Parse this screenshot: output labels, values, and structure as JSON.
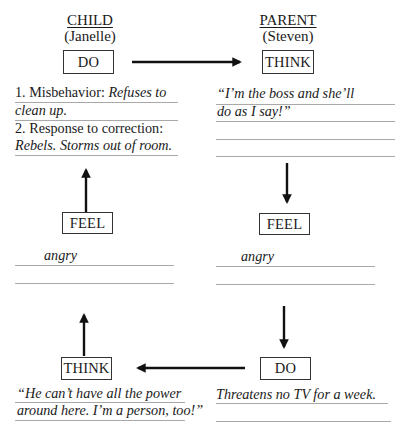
{
  "child": {
    "title": "CHILD",
    "name": "(Janelle)",
    "do_box": "DO",
    "do_lines": [
      {
        "prefix": "1. Misbehavior: ",
        "italic": "Refuses to"
      },
      {
        "prefix": "",
        "italic": "clean up."
      },
      {
        "prefix": "2. Response to correction:",
        "italic": ""
      },
      {
        "prefix": "",
        "italic": "Rebels. Storms out of room."
      }
    ],
    "feel_box": "FEEL",
    "feel_lines": [
      "angry",
      ""
    ],
    "think_box": "THINK",
    "think_lines": [
      "“He can’t have all the power",
      "around here. I’m a person, too!”"
    ]
  },
  "parent": {
    "title": "PARENT",
    "name": "(Steven)",
    "think_box": "THINK",
    "think_lines": [
      "“I’m the boss and she’ll",
      "do as I say!”",
      "",
      ""
    ],
    "feel_box": "FEEL",
    "feel_lines": [
      "angry",
      ""
    ],
    "do_box": "DO",
    "do_lines": [
      "Threatens no TV for a week.",
      ""
    ]
  },
  "arrows": [
    {
      "from": "child-do",
      "to": "parent-think",
      "direction": "right"
    },
    {
      "from": "parent-think",
      "to": "parent-feel",
      "direction": "down"
    },
    {
      "from": "parent-feel",
      "to": "parent-do",
      "direction": "down"
    },
    {
      "from": "parent-do",
      "to": "child-think",
      "direction": "left"
    },
    {
      "from": "child-think",
      "to": "child-feel",
      "direction": "up"
    },
    {
      "from": "child-feel",
      "to": "child-do",
      "direction": "up"
    }
  ]
}
